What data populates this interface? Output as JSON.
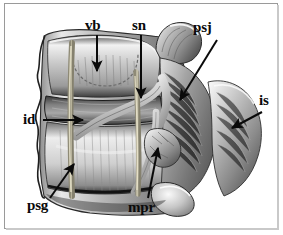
{
  "figure": {
    "frame_color": "#9a9a9a",
    "background_color": "#ffffff",
    "label_color": "#0a0a0a",
    "marker_color": "#b9b39c"
  },
  "labels": [
    {
      "id": "vb",
      "text": "vb",
      "name": "vertebral-body",
      "pointer": "arrow-down"
    },
    {
      "id": "sn",
      "text": "sn",
      "name": "spinal-nerve",
      "pointer": "arrow-down"
    },
    {
      "id": "psj",
      "text": "psj",
      "name": "posterior-spinal-joint",
      "pointer": "arrow-diagonal-down-left"
    },
    {
      "id": "is",
      "text": "is",
      "name": "interspinous-space",
      "pointer": "arrow-diagonal-down-left"
    },
    {
      "id": "id",
      "text": "id",
      "name": "intervertebral-disc",
      "pointer": "arrow-right"
    },
    {
      "id": "psg",
      "text": "psg",
      "name": "posterior-spinal-groove",
      "pointer": "arrow-diagonal-up-right"
    },
    {
      "id": "mpr",
      "text": "mpr",
      "name": "mammillary-process-region",
      "pointer": "line-up"
    }
  ]
}
